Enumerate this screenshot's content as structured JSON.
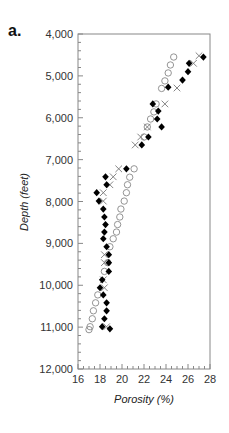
{
  "panel_label": "a.",
  "chart_data": {
    "type": "scatter",
    "title": "",
    "xlabel": "Porosity (%)",
    "ylabel": "Depth (feet)",
    "xlim": [
      16,
      28
    ],
    "ylim": [
      12000,
      4000
    ],
    "y_inverted": true,
    "x_ticks": [
      16,
      18,
      20,
      22,
      24,
      26,
      28
    ],
    "y_ticks": [
      4000,
      5000,
      6000,
      7000,
      8000,
      9000,
      10000,
      11000,
      12000
    ],
    "y_tick_labels": [
      "4,000",
      "5,000",
      "6,000",
      "7,000",
      "8,000",
      "9,000",
      "10,000",
      "11,000",
      "12,000"
    ],
    "grid": false,
    "legend": null,
    "series": [
      {
        "name": "filled-diamond",
        "marker": "diamond-filled",
        "color": "#000000",
        "points": [
          [
            27.4,
            4550
          ],
          [
            26.1,
            4700
          ],
          [
            26.0,
            4900
          ],
          [
            25.5,
            5100
          ],
          [
            24.2,
            5270
          ],
          [
            22.8,
            5670
          ],
          [
            23.3,
            5840
          ],
          [
            23.2,
            6030
          ],
          [
            23.6,
            6220
          ],
          [
            22.4,
            6460
          ],
          [
            21.8,
            6650
          ],
          [
            20.4,
            7220
          ],
          [
            18.5,
            7410
          ],
          [
            18.6,
            7600
          ],
          [
            17.7,
            7790
          ],
          [
            17.9,
            7990
          ],
          [
            18.3,
            8180
          ],
          [
            18.4,
            8370
          ],
          [
            18.5,
            8550
          ],
          [
            18.4,
            8730
          ],
          [
            18.3,
            8890
          ],
          [
            18.6,
            9080
          ],
          [
            18.8,
            9270
          ],
          [
            18.8,
            9460
          ],
          [
            18.8,
            9670
          ],
          [
            18.2,
            9870
          ],
          [
            18.0,
            10060
          ],
          [
            18.3,
            10230
          ],
          [
            18.6,
            10420
          ],
          [
            18.6,
            10610
          ],
          [
            18.4,
            10800
          ],
          [
            18.2,
            10990
          ],
          [
            18.9,
            11040
          ]
        ]
      },
      {
        "name": "cross",
        "marker": "x",
        "color": "#777777",
        "points": [
          [
            27.0,
            4520
          ],
          [
            26.5,
            4700
          ],
          [
            25.0,
            5290
          ],
          [
            23.9,
            5670
          ],
          [
            22.3,
            6220
          ],
          [
            21.7,
            6460
          ],
          [
            21.2,
            6650
          ],
          [
            19.7,
            7220
          ],
          [
            19.2,
            7410
          ],
          [
            18.9,
            7600
          ],
          [
            18.3,
            7790
          ],
          [
            18.3,
            7990
          ],
          [
            18.4,
            9270
          ],
          [
            18.4,
            9460
          ],
          [
            18.3,
            9870
          ],
          [
            18.4,
            10060
          ],
          [
            18.6,
            10990
          ]
        ]
      },
      {
        "name": "open-circle",
        "marker": "circle-open",
        "color": "#888888",
        "points": [
          [
            24.7,
            4550
          ],
          [
            24.4,
            4740
          ],
          [
            24.2,
            4930
          ],
          [
            23.9,
            5120
          ],
          [
            23.6,
            5300
          ],
          [
            23.1,
            5670
          ],
          [
            22.9,
            5860
          ],
          [
            22.6,
            6030
          ],
          [
            22.3,
            6220
          ],
          [
            22.0,
            6460
          ],
          [
            21.1,
            7220
          ],
          [
            20.7,
            7420
          ],
          [
            20.5,
            7600
          ],
          [
            20.4,
            7790
          ],
          [
            20.2,
            7990
          ],
          [
            19.9,
            8180
          ],
          [
            19.8,
            8370
          ],
          [
            19.6,
            8550
          ],
          [
            19.5,
            8730
          ],
          [
            19.2,
            8890
          ],
          [
            18.9,
            9080
          ],
          [
            18.7,
            9460
          ],
          [
            18.4,
            9670
          ],
          [
            17.8,
            10230
          ],
          [
            17.6,
            10420
          ],
          [
            17.4,
            10610
          ],
          [
            17.3,
            10800
          ],
          [
            17.1,
            10990
          ],
          [
            17.0,
            11060
          ]
        ]
      }
    ]
  }
}
